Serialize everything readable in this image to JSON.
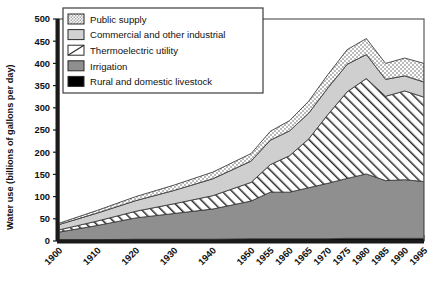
{
  "chart_data": {
    "type": "area",
    "title": "",
    "xlabel": "",
    "ylabel": "Water use (billions of gallons per day)",
    "ylim": [
      0,
      500
    ],
    "yticks": [
      0,
      50,
      100,
      150,
      200,
      250,
      300,
      350,
      400,
      450,
      500
    ],
    "grid": false,
    "stacked": true,
    "legend_position": "top-left",
    "categories": [
      "1900",
      "1910",
      "1920",
      "1930",
      "1940",
      "1950",
      "1955",
      "1960",
      "1965",
      "1970",
      "1975",
      "1980",
      "1985",
      "1990",
      "1995"
    ],
    "series": [
      {
        "name": "Rural and domestic livestock",
        "pattern": "solid-black",
        "color": "#000000",
        "values": [
          3,
          3,
          4,
          4,
          4,
          5,
          5,
          5,
          5,
          5,
          6,
          6,
          6,
          6,
          6
        ]
      },
      {
        "name": "Irrigation",
        "pattern": "solid-dark-gray",
        "color": "#8c8c8c",
        "values": [
          17,
          32,
          48,
          58,
          68,
          85,
          105,
          105,
          115,
          125,
          135,
          145,
          130,
          132,
          128
        ]
      },
      {
        "name": "Thermoelectric utility",
        "pattern": "diagonal-hatch",
        "color": "#ffffff",
        "values": [
          5,
          10,
          15,
          22,
          30,
          42,
          62,
          82,
          110,
          155,
          195,
          215,
          190,
          200,
          190
        ]
      },
      {
        "name": "Commercial and other industrial",
        "pattern": "solid-light-gray",
        "color": "#cccccc",
        "values": [
          12,
          18,
          24,
          30,
          38,
          48,
          55,
          56,
          58,
          60,
          62,
          54,
          38,
          34,
          34
        ]
      },
      {
        "name": "Public supply",
        "pattern": "stipple-dots",
        "color": "#ffffff",
        "values": [
          3,
          6,
          9,
          12,
          15,
          17,
          20,
          23,
          27,
          30,
          33,
          36,
          36,
          40,
          42
        ]
      }
    ],
    "totals": [
      40,
      69,
      100,
      126,
      155,
      197,
      247,
      271,
      315,
      375,
      431,
      456,
      400,
      412,
      400
    ]
  },
  "axis": {
    "y_title": "Water use (billions of gallons per day)"
  },
  "legend": {
    "items": [
      {
        "label": "Public supply",
        "swatch": "stipple-swatch"
      },
      {
        "label": "Commercial and other industrial",
        "swatch": "light-gray-swatch"
      },
      {
        "label": "Thermoelectric utility",
        "swatch": "hatch-swatch"
      },
      {
        "label": "Irrigation",
        "swatch": "dark-gray-swatch"
      },
      {
        "label": "Rural and domestic livestock",
        "swatch": "black-swatch"
      }
    ]
  }
}
